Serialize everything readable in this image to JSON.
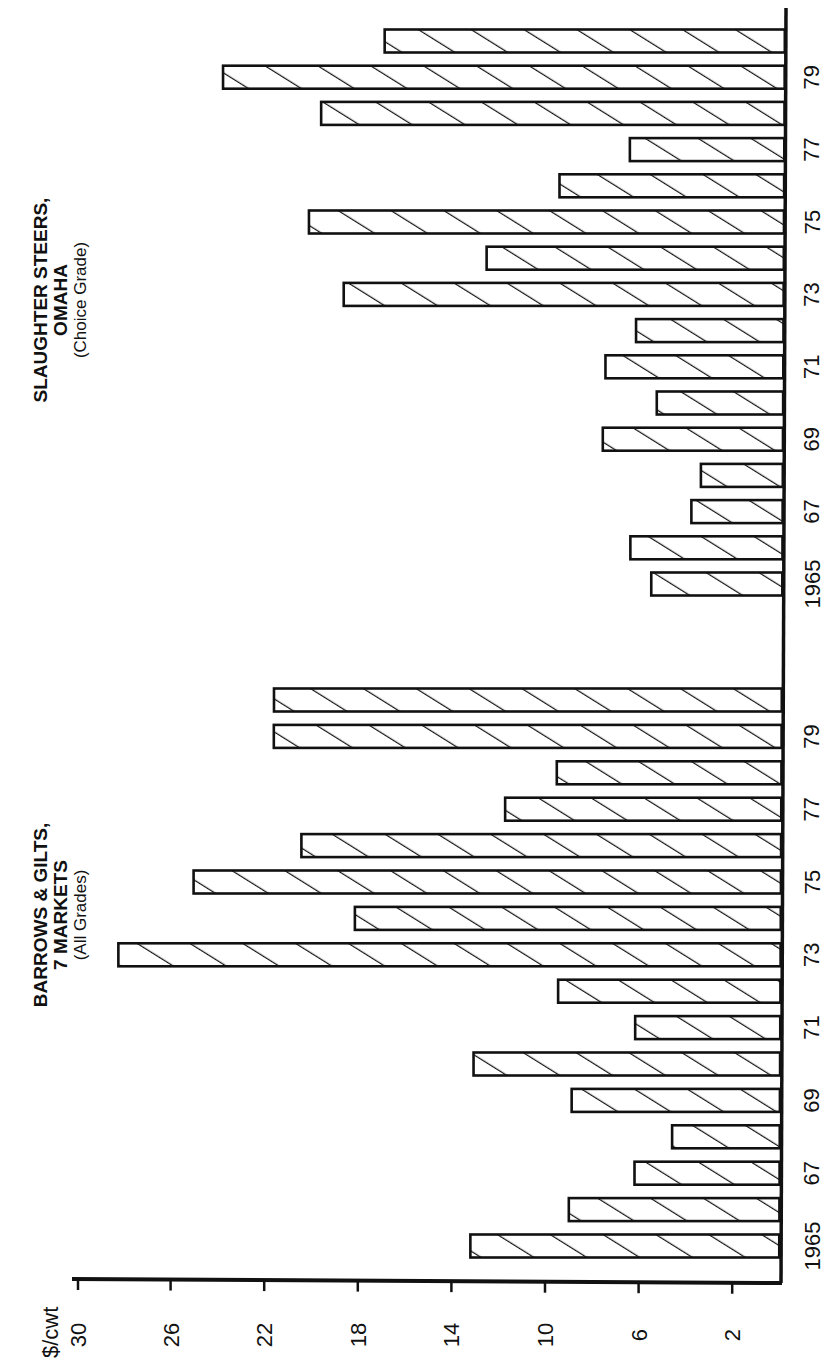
{
  "chart_data": {
    "type": "bar",
    "orientation": "rotated 90 degrees clockwise (value axis horizontal, increasing leftward)",
    "ylabel": "$/cwt",
    "ylim": [
      0,
      30
    ],
    "yticks": [
      2,
      6,
      10,
      14,
      18,
      22,
      26,
      30
    ],
    "grid": false,
    "categories": [
      "1965",
      "1966",
      "1967",
      "1968",
      "1969",
      "1970",
      "1971",
      "1972",
      "1973",
      "1974",
      "1975",
      "1976",
      "1977",
      "1978",
      "1979",
      "1980"
    ],
    "panels": [
      {
        "name": "barrows",
        "title_lines": [
          "BARROWS & GILTS,",
          "7 MARKETS",
          "(All Grades)"
        ],
        "year_tick_labels": [
          {
            "index": 0,
            "label": "1965"
          },
          {
            "index": 2,
            "label": "67"
          },
          {
            "index": 4,
            "label": "69"
          },
          {
            "index": 6,
            "label": "71"
          },
          {
            "index": 8,
            "label": "73"
          },
          {
            "index": 10,
            "label": "75"
          },
          {
            "index": 12,
            "label": "77"
          },
          {
            "index": 14,
            "label": "79"
          }
        ],
        "values": [
          13.2,
          9.0,
          6.2,
          4.6,
          8.9,
          13.1,
          6.2,
          9.5,
          28.3,
          18.2,
          25.1,
          20.5,
          11.8,
          9.6,
          21.7,
          21.7
        ]
      },
      {
        "name": "steers",
        "title_lines": [
          "SLAUGHTER STEERS,",
          "OMAHA",
          "(Choice Grade)"
        ],
        "year_tick_labels": [
          {
            "index": 0,
            "label": "1965"
          },
          {
            "index": 2,
            "label": "67"
          },
          {
            "index": 4,
            "label": "69"
          },
          {
            "index": 6,
            "label": "71"
          },
          {
            "index": 8,
            "label": "73"
          },
          {
            "index": 10,
            "label": "75"
          },
          {
            "index": 12,
            "label": "77"
          },
          {
            "index": 14,
            "label": "79"
          }
        ],
        "values": [
          5.6,
          6.5,
          3.9,
          3.5,
          7.7,
          5.4,
          7.6,
          6.3,
          18.8,
          12.7,
          20.3,
          9.6,
          6.6,
          19.8,
          24.0,
          17.1
        ]
      }
    ],
    "series": [
      {
        "name": "Barrows & Gilts, 7 Markets (All Grades)",
        "values": [
          13.2,
          9.0,
          6.2,
          4.6,
          8.9,
          13.1,
          6.2,
          9.5,
          28.3,
          18.2,
          25.1,
          20.5,
          11.8,
          9.6,
          21.7,
          21.7
        ]
      },
      {
        "name": "Slaughter Steers, Omaha (Choice Grade)",
        "values": [
          5.6,
          6.5,
          3.9,
          3.5,
          7.7,
          5.4,
          7.6,
          6.3,
          18.8,
          12.7,
          20.3,
          9.6,
          6.6,
          19.8,
          24.0,
          17.1
        ]
      }
    ],
    "colors": {
      "ink": "#111111",
      "background": "#ffffff"
    }
  }
}
